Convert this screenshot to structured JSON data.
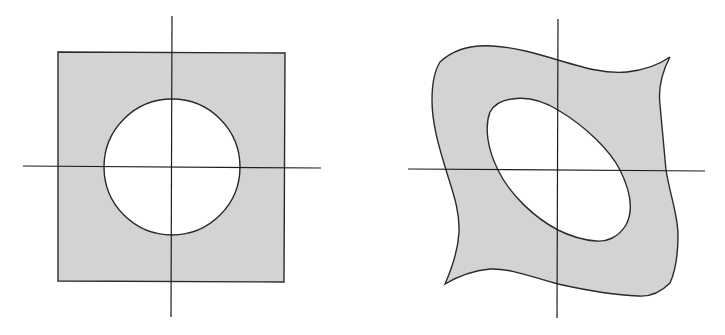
{
  "figure": {
    "colors": {
      "region_fill": "#d3d3d3",
      "hole_fill": "#ffffff",
      "stroke": "#2a2a2a",
      "background": "#ffffff"
    },
    "panels": [
      {
        "id": "left",
        "shape": "square-with-circular-hole",
        "axes": {
          "origin": [
            172,
            167
          ]
        },
        "square": {
          "x": 58,
          "y": 52,
          "width": 227,
          "height": 230
        },
        "hole": {
          "type": "circle",
          "cx": 172,
          "cy": 167,
          "r": 68
        }
      },
      {
        "id": "right",
        "shape": "warped-region-with-elliptical-hole",
        "axes": {
          "origin": [
            558,
            170
          ]
        },
        "hole": {
          "type": "ellipse",
          "cx": 562,
          "cy": 169,
          "rx": 82,
          "ry": 42,
          "rotation_deg": 47
        }
      }
    ]
  }
}
